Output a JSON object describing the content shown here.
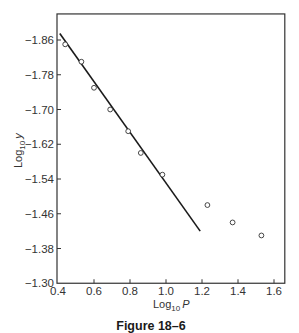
{
  "figure": {
    "caption": "Figure 18–6"
  },
  "chart_data": {
    "type": "scatter",
    "title": "",
    "caption": "Figure 18–6",
    "xlabel": "Log10 P",
    "xlabel_main": "Log",
    "xlabel_sub": "10",
    "xlabel_var": "P",
    "ylabel": "Log10 y",
    "ylabel_main": "Log",
    "ylabel_sub": "10",
    "ylabel_var": "y",
    "xlim": [
      0.4,
      1.66
    ],
    "ylim": [
      -1.92,
      -1.3
    ],
    "y_axis_inverted": true,
    "xticks": [
      0.4,
      0.6,
      0.8,
      1.0,
      1.2,
      1.4,
      1.6
    ],
    "xtick_labels": [
      "0.4",
      "0.6",
      "0.8",
      "1.0",
      "1.2",
      "1.4",
      "1.6"
    ],
    "yticks": [
      -1.86,
      -1.78,
      -1.7,
      -1.62,
      -1.54,
      -1.46,
      -1.38,
      -1.3
    ],
    "ytick_labels": [
      "−1.86",
      "−1.78",
      "−1.70",
      "−1.62",
      "−1.54",
      "−1.46",
      "−1.38",
      "−1.30"
    ],
    "grid": false,
    "legend": null,
    "series": [
      {
        "name": "observed",
        "marker": "open-circle",
        "x": [
          0.44,
          0.53,
          0.6,
          0.69,
          0.79,
          0.86,
          0.98,
          1.23,
          1.37,
          1.53
        ],
        "y": [
          -1.85,
          -1.81,
          -1.75,
          -1.7,
          -1.65,
          -1.6,
          -1.55,
          -1.48,
          -1.44,
          -1.41
        ]
      },
      {
        "name": "fitted line",
        "marker": "line",
        "x": [
          0.41,
          1.19
        ],
        "y": [
          -1.875,
          -1.42
        ]
      }
    ],
    "colors": {
      "line": "#1a1a1a",
      "marker": "#333333",
      "axis": "#333333"
    }
  }
}
